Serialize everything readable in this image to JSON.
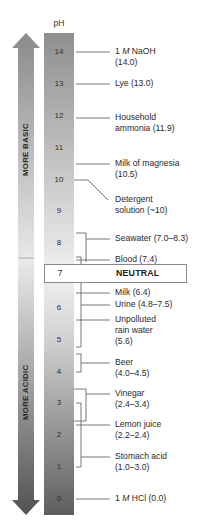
{
  "scale": {
    "header": "pH",
    "ticks": [
      "14",
      "13",
      "12",
      "11",
      "10",
      "9",
      "8",
      "7",
      "6",
      "5",
      "4",
      "3",
      "2",
      "1",
      "0"
    ]
  },
  "arrows": {
    "up_label": "MORE BASIC",
    "down_label": "MORE ACIDIC"
  },
  "neutral": {
    "value": "7",
    "label": "NEUTRAL"
  },
  "substances": [
    {
      "name_prefix": "1 ",
      "name_italic": "M",
      "name_suffix": " NaOH",
      "value": "(14.0)"
    },
    {
      "line1": "Lye (13.0)"
    },
    {
      "line1": "Household",
      "line2": "ammonia (11.9)"
    },
    {
      "line1": "Milk of magnesia",
      "line2": "(10.5)"
    },
    {
      "line1": "Detergent",
      "line2": "solution (~10)"
    },
    {
      "line1": "Seawater (7.0–8.3)"
    },
    {
      "line1": "Blood (7.4)"
    },
    {
      "line1": "Milk (6.4)"
    },
    {
      "line1": "Urine (4.8–7.5)"
    },
    {
      "line1": "Unpolluted",
      "line2": "rain water",
      "line3": "(5.6)"
    },
    {
      "line1": "Beer",
      "line2": "(4.0–4.5)"
    },
    {
      "line1": "Vinegar",
      "line2": "(2.4–3.4)"
    },
    {
      "line1": "Lemon juice",
      "line2": "(2.2–2.4)"
    },
    {
      "line1": "Stomach acid",
      "line2": "(1.0–3.0)"
    },
    {
      "name_prefix": "1 ",
      "name_italic": "M",
      "name_suffix": " HCl (0.0)"
    }
  ],
  "colors": {
    "scale_top": "#8f8f8f",
    "scale_mid": "#ececec",
    "scale_bottom": "#5e5e5e",
    "arrow_top": "#8a8a8a",
    "arrow_mid": "#e6e6e6",
    "arrow_bottom": "#555555",
    "leader_line": "#555555"
  }
}
